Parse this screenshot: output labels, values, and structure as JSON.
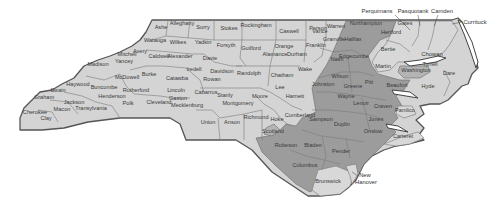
{
  "map": {
    "title": "North Carolina counties",
    "colors": {
      "light": "#d4d4d4",
      "dark": "#9c9c9c",
      "mid": "#b4b4b4",
      "outline": "#555555"
    },
    "counties": [
      {
        "name": "Ashe",
        "x": 161,
        "y": 29,
        "shade": "light"
      },
      {
        "name": "Alleghany",
        "x": 182,
        "y": 25,
        "shade": "light"
      },
      {
        "name": "Surry",
        "x": 203,
        "y": 29,
        "shade": "light"
      },
      {
        "name": "Stokes",
        "x": 229,
        "y": 30,
        "shade": "light"
      },
      {
        "name": "Rockingham",
        "x": 256,
        "y": 27,
        "shade": "light"
      },
      {
        "name": "Caswell",
        "x": 289,
        "y": 33,
        "shade": "light"
      },
      {
        "name": "Person",
        "x": 318,
        "y": 30,
        "shade": "light"
      },
      {
        "name": "Granville",
        "x": 334,
        "y": 41,
        "shade": "light"
      },
      {
        "name": "Vance",
        "x": 320,
        "y": 33,
        "shade": "light"
      },
      {
        "name": "Warren",
        "x": 336,
        "y": 28,
        "shade": "light"
      },
      {
        "name": "Northampton",
        "x": 366,
        "y": 25,
        "shade": "dark"
      },
      {
        "name": "Hertford",
        "x": 391,
        "y": 34,
        "shade": "light"
      },
      {
        "name": "Gates",
        "x": 405,
        "y": 25,
        "shade": "light"
      },
      {
        "name": "Watauga",
        "x": 155,
        "y": 42,
        "shade": "light"
      },
      {
        "name": "Wilkes",
        "x": 178,
        "y": 44,
        "shade": "light"
      },
      {
        "name": "Yadkin",
        "x": 203,
        "y": 44,
        "shade": "light"
      },
      {
        "name": "Forsyth",
        "x": 226,
        "y": 47,
        "shade": "light"
      },
      {
        "name": "Guilford",
        "x": 251,
        "y": 50,
        "shade": "light"
      },
      {
        "name": "Orange",
        "x": 284,
        "y": 48,
        "shade": "light"
      },
      {
        "name": "Alamance",
        "x": 275,
        "y": 56,
        "shade": "light"
      },
      {
        "name": "Durham",
        "x": 297,
        "y": 56,
        "shade": "light"
      },
      {
        "name": "Franklin",
        "x": 316,
        "y": 47,
        "shade": "light"
      },
      {
        "name": "Halifax",
        "x": 353,
        "y": 41,
        "shade": "dark"
      },
      {
        "name": "Bertie",
        "x": 388,
        "y": 51,
        "shade": "light"
      },
      {
        "name": "Avery",
        "x": 140,
        "y": 53,
        "shade": "light"
      },
      {
        "name": "Mitchell",
        "x": 127,
        "y": 56,
        "shade": "light"
      },
      {
        "name": "Yancey",
        "x": 124,
        "y": 63,
        "shade": "light"
      },
      {
        "name": "Caldwell",
        "x": 159,
        "y": 58,
        "shade": "light"
      },
      {
        "name": "Alexander",
        "x": 180,
        "y": 58,
        "shade": "light"
      },
      {
        "name": "Davie",
        "x": 210,
        "y": 60,
        "shade": "light"
      },
      {
        "name": "Nash",
        "x": 337,
        "y": 61,
        "shade": "dark"
      },
      {
        "name": "Edgecombe",
        "x": 354,
        "y": 58,
        "shade": "dark"
      },
      {
        "name": "Martin",
        "x": 383,
        "y": 68,
        "shade": "light"
      },
      {
        "name": "Wake",
        "x": 305,
        "y": 71,
        "shade": "light"
      },
      {
        "name": "Madison",
        "x": 98,
        "y": 66,
        "shade": "light"
      },
      {
        "name": "Iredell",
        "x": 194,
        "y": 71,
        "shade": "light"
      },
      {
        "name": "Davidson",
        "x": 222,
        "y": 73,
        "shade": "light"
      },
      {
        "name": "Randolph",
        "x": 249,
        "y": 75,
        "shade": "light"
      },
      {
        "name": "Chatham",
        "x": 282,
        "y": 77,
        "shade": "light"
      },
      {
        "name": "Washington",
        "x": 416,
        "y": 72,
        "shade": "mid"
      },
      {
        "name": "Tyrrell",
        "x": 430,
        "y": 66,
        "shade": "light"
      },
      {
        "name": "McDowell",
        "x": 127,
        "y": 79,
        "shade": "light"
      },
      {
        "name": "Burke",
        "x": 149,
        "y": 76,
        "shade": "light"
      },
      {
        "name": "Catawba",
        "x": 177,
        "y": 80,
        "shade": "light"
      },
      {
        "name": "Rowan",
        "x": 212,
        "y": 81,
        "shade": "light"
      },
      {
        "name": "Wilson",
        "x": 340,
        "y": 78,
        "shade": "dark"
      },
      {
        "name": "Dare",
        "x": 449,
        "y": 75,
        "shade": "light"
      },
      {
        "name": "Haywood",
        "x": 78,
        "y": 86,
        "shade": "light"
      },
      {
        "name": "Buncombe",
        "x": 104,
        "y": 89,
        "shade": "light"
      },
      {
        "name": "Rutherford",
        "x": 136,
        "y": 92,
        "shade": "light"
      },
      {
        "name": "Lincoln",
        "x": 176,
        "y": 92,
        "shade": "light"
      },
      {
        "name": "Cabarrus",
        "x": 206,
        "y": 94,
        "shade": "light"
      },
      {
        "name": "Stanly",
        "x": 225,
        "y": 97,
        "shade": "light"
      },
      {
        "name": "Lee",
        "x": 280,
        "y": 89,
        "shade": "light"
      },
      {
        "name": "Harnett",
        "x": 295,
        "y": 98,
        "shade": "light"
      },
      {
        "name": "Johnston",
        "x": 323,
        "y": 86,
        "shade": "dark"
      },
      {
        "name": "Greene",
        "x": 353,
        "y": 88,
        "shade": "dark"
      },
      {
        "name": "Pitt",
        "x": 369,
        "y": 84,
        "shade": "dark"
      },
      {
        "name": "Beaufort",
        "x": 397,
        "y": 87,
        "shade": "dark"
      },
      {
        "name": "Hyde",
        "x": 428,
        "y": 88,
        "shade": "light"
      },
      {
        "name": "Swain",
        "x": 58,
        "y": 92,
        "shade": "light"
      },
      {
        "name": "Graham",
        "x": 44,
        "y": 99,
        "shade": "light"
      },
      {
        "name": "Jackson",
        "x": 74,
        "y": 104,
        "shade": "light"
      },
      {
        "name": "Henderson",
        "x": 112,
        "y": 98,
        "shade": "light"
      },
      {
        "name": "Polk",
        "x": 128,
        "y": 105,
        "shade": "light"
      },
      {
        "name": "Cleveland",
        "x": 159,
        "y": 104,
        "shade": "light"
      },
      {
        "name": "Gaston",
        "x": 178,
        "y": 100,
        "shade": "light"
      },
      {
        "name": "Mecklenburg",
        "x": 187,
        "y": 107,
        "shade": "light"
      },
      {
        "name": "Montgomery",
        "x": 238,
        "y": 105,
        "shade": "light"
      },
      {
        "name": "Moore",
        "x": 260,
        "y": 98,
        "shade": "light"
      },
      {
        "name": "Wayne",
        "x": 346,
        "y": 98,
        "shade": "dark"
      },
      {
        "name": "Lenoir",
        "x": 361,
        "y": 105,
        "shade": "dark"
      },
      {
        "name": "Craven",
        "x": 383,
        "y": 108,
        "shade": "dark"
      },
      {
        "name": "Pamlico",
        "x": 405,
        "y": 112,
        "shade": "light"
      },
      {
        "name": "Cherokee",
        "x": 35,
        "y": 114,
        "shade": "light"
      },
      {
        "name": "Macon",
        "x": 62,
        "y": 111,
        "shade": "light"
      },
      {
        "name": "Transylvania",
        "x": 91,
        "y": 110,
        "shade": "light"
      },
      {
        "name": "Clay",
        "x": 46,
        "y": 120,
        "shade": "light"
      },
      {
        "name": "Union",
        "x": 208,
        "y": 124,
        "shade": "light"
      },
      {
        "name": "Anson",
        "x": 232,
        "y": 124,
        "shade": "light"
      },
      {
        "name": "Richmond",
        "x": 256,
        "y": 119,
        "shade": "light"
      },
      {
        "name": "Hoke",
        "x": 277,
        "y": 121,
        "shade": "light"
      },
      {
        "name": "Cumberland",
        "x": 300,
        "y": 117,
        "shade": "light"
      },
      {
        "name": "Sampson",
        "x": 321,
        "y": 121,
        "shade": "dark"
      },
      {
        "name": "Duplin",
        "x": 342,
        "y": 126,
        "shade": "dark"
      },
      {
        "name": "Jones",
        "x": 376,
        "y": 121,
        "shade": "dark"
      },
      {
        "name": "Onslow",
        "x": 373,
        "y": 133,
        "shade": "dark"
      },
      {
        "name": "Carteret",
        "x": 403,
        "y": 138,
        "shade": "light"
      },
      {
        "name": "Scotland",
        "x": 273,
        "y": 133,
        "shade": "mid"
      },
      {
        "name": "Robeson",
        "x": 286,
        "y": 147,
        "shade": "dark"
      },
      {
        "name": "Bladen",
        "x": 313,
        "y": 147,
        "shade": "dark"
      },
      {
        "name": "Pender",
        "x": 341,
        "y": 153,
        "shade": "dark"
      },
      {
        "name": "Columbus",
        "x": 305,
        "y": 167,
        "shade": "dark"
      },
      {
        "name": "Brunswick",
        "x": 328,
        "y": 183,
        "shade": "light"
      }
    ],
    "outside_labels": [
      {
        "name": "Perquimans",
        "x": 377,
        "y": 13
      },
      {
        "name": "Pasquotank",
        "x": 413,
        "y": 13
      },
      {
        "name": "Camden",
        "x": 442,
        "y": 13
      },
      {
        "name": "Currituck",
        "x": 475,
        "y": 24
      },
      {
        "name": "Chowan",
        "x": 432,
        "y": 56
      },
      {
        "name": "New",
        "x": 365,
        "y": 177
      },
      {
        "name": "Hanover",
        "x": 366,
        "y": 184
      }
    ]
  }
}
